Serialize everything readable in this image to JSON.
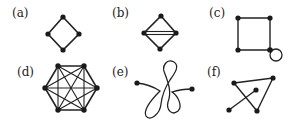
{
  "panels": [
    {
      "id": "a",
      "label": "(a)",
      "description": "Cycle graph C4 drawn as a diamond (4 vertices, 4 edges)"
    },
    {
      "id": "b",
      "label": "(b)",
      "description": "Diamond with two parallel edges (multi-edge) between left and right vertices"
    },
    {
      "id": "c",
      "label": "(c)",
      "description": "Square (4-cycle) with a self-loop at bottom-right vertex"
    },
    {
      "id": "d",
      "label": "(d)",
      "description": "Complete graph K6 on a hexagon"
    },
    {
      "id": "e",
      "label": "(e)",
      "description": "Single curve path with two endpoints crossing itself forming loops"
    },
    {
      "id": "f",
      "label": "(f)",
      "description": "Triangle with a separate crossing edge (disconnected graph with 5 vertices)"
    }
  ],
  "colors": {
    "ink": "#1a1a1a",
    "background": "#ffffff"
  }
}
